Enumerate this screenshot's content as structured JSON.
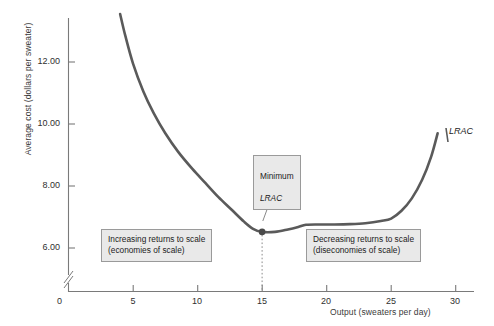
{
  "chart_data": {
    "type": "line",
    "title": "",
    "xlabel": "Output (sweaters per day)",
    "ylabel": "Average cost (dollars per sweater)",
    "xlim": [
      0,
      30
    ],
    "ylim": [
      5.5,
      13.6
    ],
    "grid": false,
    "y_axis_break": true,
    "xticks": [
      "0",
      "5",
      "10",
      "15",
      "20",
      "25",
      "30"
    ],
    "xtick_values": [
      0,
      5,
      10,
      15,
      20,
      25,
      30
    ],
    "yticks": [
      "6.00",
      "8.00",
      "10.00",
      "12.00"
    ],
    "ytick_values": [
      6.0,
      8.0,
      10.0,
      12.0
    ],
    "series": [
      {
        "name": "LRAC",
        "color": "#5a5a5a",
        "x": [
          4.0,
          4.4,
          5.0,
          5.8,
          6.6,
          7.5,
          8.5,
          9.6,
          10.6,
          11.6,
          12.6,
          13.6,
          14.3,
          15.0,
          16.0,
          17.0,
          17.8,
          18.4,
          19.4,
          20.6,
          21.8,
          23.0,
          24.2,
          25.0,
          25.8,
          26.6,
          27.4,
          28.1,
          28.6
        ],
        "y": [
          13.55,
          12.85,
          11.95,
          11.05,
          10.35,
          9.7,
          9.1,
          8.55,
          8.1,
          7.65,
          7.25,
          6.85,
          6.62,
          6.52,
          6.52,
          6.6,
          6.68,
          6.75,
          6.76,
          6.76,
          6.77,
          6.8,
          6.87,
          6.95,
          7.2,
          7.6,
          8.2,
          8.95,
          9.7
        ]
      }
    ],
    "annotations": [
      {
        "name": "minimum-point",
        "x": 15,
        "y": 6.52,
        "label_line1": "Minimum",
        "label_line2": "LRAC",
        "marker": "filled-circle",
        "has_dropline": true
      },
      {
        "name": "increasing-returns-note",
        "text": "Increasing returns to scale\n(economies of scale)"
      },
      {
        "name": "decreasing-returns-note",
        "text": "Decreasing returns to scale\n(diseconomies of scale)"
      },
      {
        "name": "curve-label",
        "text": "LRAC"
      }
    ]
  },
  "axes": {
    "ylabel": "Average cost (dollars per sweater)",
    "xlabel": "Output (sweaters per day)",
    "yticks": [
      "12.00",
      "10.00",
      "8.00",
      "6.00"
    ],
    "origin_label": "0",
    "xticks": [
      "5",
      "10",
      "15",
      "20",
      "25",
      "30"
    ]
  },
  "callouts": {
    "minimum_line1": "Minimum",
    "minimum_line2": "LRAC",
    "increasing": "Increasing returns to scale\n(economies of scale)",
    "decreasing": "Decreasing returns to scale\n(diseconomies of scale)",
    "curve_label": "LRAC"
  },
  "colors": {
    "curve": "#5a5a5a",
    "axis": "#6f6f6f",
    "callout_bg": "#e9e9e9",
    "callout_border": "#9a9a9a",
    "text": "#1c1c1c"
  }
}
